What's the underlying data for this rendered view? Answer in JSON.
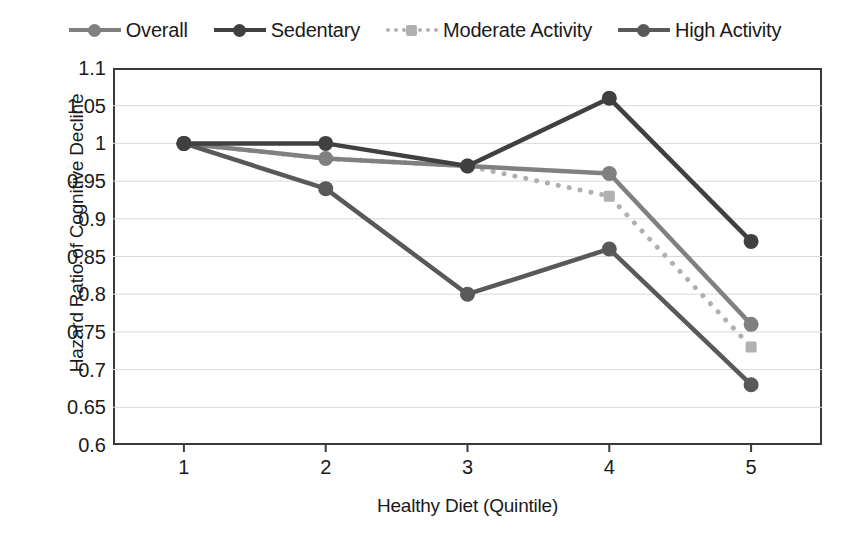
{
  "chart_data": {
    "type": "line",
    "title": "",
    "xlabel": "Healthy Diet (Quintile)",
    "ylabel": "Hazard Ratio of Cognitive Decline",
    "categories": [
      "1",
      "2",
      "3",
      "4",
      "5"
    ],
    "x": [
      1,
      2,
      3,
      4,
      5
    ],
    "xlim": [
      0.5,
      5.5
    ],
    "ylim": [
      0.6,
      1.1
    ],
    "yticks": [
      "1.1",
      "1.05",
      "1",
      "0.95",
      "0.9",
      "0.85",
      "0.8",
      "0.75",
      "0.7",
      "0.65",
      "0.6"
    ],
    "ytick_values": [
      1.1,
      1.05,
      1.0,
      0.95,
      0.9,
      0.85,
      0.8,
      0.75,
      0.7,
      0.65,
      0.6
    ],
    "grid": true,
    "grid_axis": "y",
    "legend_position": "top",
    "series": [
      {
        "name": "Overall",
        "values": [
          1.0,
          0.98,
          0.97,
          0.96,
          0.76
        ],
        "color": "#808080",
        "line_style": "solid",
        "marker": "circle"
      },
      {
        "name": "Sedentary",
        "values": [
          1.0,
          1.0,
          0.97,
          1.06,
          0.87
        ],
        "color": "#404040",
        "line_style": "solid",
        "marker": "circle"
      },
      {
        "name": "Moderate Activity",
        "values": [
          1.0,
          0.98,
          0.97,
          0.93,
          0.73
        ],
        "color": "#b0b0b0",
        "line_style": "dotted",
        "marker": "square"
      },
      {
        "name": "High Activity",
        "values": [
          1.0,
          0.94,
          0.8,
          0.86,
          0.68
        ],
        "color": "#595959",
        "line_style": "solid",
        "marker": "circle"
      }
    ]
  },
  "colors": {
    "axis": "#3a3a3a",
    "grid": "#d9d9d9",
    "text": "#1a1a1a",
    "background": "#ffffff"
  }
}
